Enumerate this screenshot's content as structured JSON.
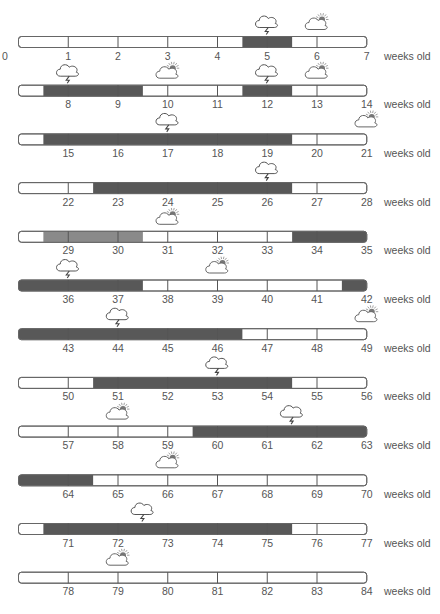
{
  "chart_data": {
    "type": "timeline",
    "title": "",
    "unit_label": "weeks old",
    "weeks_per_row": 7,
    "x_range": [
      0,
      84
    ],
    "colors": {
      "dark_fill": "#585858",
      "medium_fill": "#8a8a8a",
      "outline": "#666666",
      "text": "#555555"
    },
    "legend": [],
    "rows": [
      {
        "start": 0,
        "end": 7,
        "fills": [
          {
            "from": 4.5,
            "to": 5.5,
            "shade": "dark"
          }
        ],
        "icons": [
          {
            "week": 5,
            "type": "storm"
          },
          {
            "week": 6,
            "type": "partly-cloudy"
          }
        ]
      },
      {
        "start": 7,
        "end": 14,
        "fills": [
          {
            "from": 7.5,
            "to": 9.5,
            "shade": "dark"
          },
          {
            "from": 11.5,
            "to": 12.5,
            "shade": "dark"
          }
        ],
        "icons": [
          {
            "week": 8,
            "type": "storm"
          },
          {
            "week": 10,
            "type": "partly-cloudy"
          },
          {
            "week": 12,
            "type": "storm"
          },
          {
            "week": 13,
            "type": "partly-cloudy"
          }
        ]
      },
      {
        "start": 14,
        "end": 21,
        "fills": [
          {
            "from": 14.5,
            "to": 19.5,
            "shade": "dark"
          }
        ],
        "icons": [
          {
            "week": 17,
            "type": "storm"
          },
          {
            "week": 21,
            "type": "partly-cloudy"
          }
        ]
      },
      {
        "start": 21,
        "end": 28,
        "fills": [
          {
            "from": 22.5,
            "to": 26.5,
            "shade": "dark"
          }
        ],
        "icons": [
          {
            "week": 26,
            "type": "storm"
          }
        ]
      },
      {
        "start": 28,
        "end": 35,
        "fills": [
          {
            "from": 28.5,
            "to": 30.5,
            "shade": "medium"
          },
          {
            "from": 33.5,
            "to": 35,
            "shade": "dark"
          }
        ],
        "icons": [
          {
            "week": 31,
            "type": "partly-cloudy"
          }
        ]
      },
      {
        "start": 35,
        "end": 42,
        "fills": [
          {
            "from": 35,
            "to": 37.5,
            "shade": "dark"
          },
          {
            "from": 41.5,
            "to": 42,
            "shade": "dark"
          }
        ],
        "icons": [
          {
            "week": 36,
            "type": "storm"
          },
          {
            "week": 39,
            "type": "partly-cloudy"
          }
        ]
      },
      {
        "start": 42,
        "end": 49,
        "fills": [
          {
            "from": 42,
            "to": 46.5,
            "shade": "dark"
          }
        ],
        "icons": [
          {
            "week": 44,
            "type": "storm"
          },
          {
            "week": 49,
            "type": "partly-cloudy"
          }
        ]
      },
      {
        "start": 49,
        "end": 56,
        "fills": [
          {
            "from": 50.5,
            "to": 54.5,
            "shade": "dark"
          }
        ],
        "icons": [
          {
            "week": 53,
            "type": "storm"
          }
        ]
      },
      {
        "start": 56,
        "end": 63,
        "fills": [
          {
            "from": 59.5,
            "to": 63,
            "shade": "dark"
          }
        ],
        "icons": [
          {
            "week": 58,
            "type": "partly-cloudy"
          },
          {
            "week": 61.5,
            "type": "storm"
          }
        ]
      },
      {
        "start": 63,
        "end": 70,
        "fills": [
          {
            "from": 63,
            "to": 64.5,
            "shade": "dark"
          }
        ],
        "icons": [
          {
            "week": 66,
            "type": "partly-cloudy"
          }
        ]
      },
      {
        "start": 70,
        "end": 77,
        "fills": [
          {
            "from": 70.5,
            "to": 75.5,
            "shade": "dark"
          }
        ],
        "icons": [
          {
            "week": 72.5,
            "type": "storm"
          }
        ]
      },
      {
        "start": 77,
        "end": 84,
        "fills": [],
        "icons": [
          {
            "week": 79,
            "type": "partly-cloudy"
          }
        ]
      }
    ]
  }
}
